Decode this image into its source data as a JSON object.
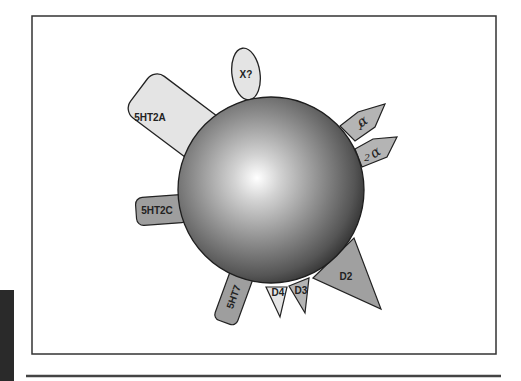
{
  "figure": {
    "type": "receptor-binding diagram",
    "center": "drug molecule (sphere)",
    "receptors": [
      {
        "id": "5ht2a",
        "label": "5HT2A",
        "shape": "rounded-rectangle",
        "fill": "#e4e4e4"
      },
      {
        "id": "x",
        "label": "X?",
        "shape": "ellipse",
        "fill": "#e4e4e4"
      },
      {
        "id": "alpha1",
        "label": "α",
        "subscript": "1",
        "shape": "pentagon-arrow",
        "fill": "#b4b4b4"
      },
      {
        "id": "alpha2",
        "label": "α",
        "subscript": "2",
        "shape": "pentagon-arrow",
        "fill": "#b4b4b4"
      },
      {
        "id": "5ht2c",
        "label": "5HT2C",
        "shape": "rounded-rectangle",
        "fill": "#9e9e9e"
      },
      {
        "id": "5ht7",
        "label": "5HT7",
        "shape": "rounded-rectangle",
        "fill": "#9e9e9e"
      },
      {
        "id": "d4",
        "label": "D4",
        "shape": "triangle",
        "fill": "#e4e4e4"
      },
      {
        "id": "d3",
        "label": "D3",
        "shape": "triangle",
        "fill": "#b4b4b4"
      },
      {
        "id": "d2",
        "label": "D2",
        "shape": "triangle",
        "fill": "#a0a0a0"
      }
    ]
  },
  "colors": {
    "outline": "#222222",
    "frame": "#333333",
    "sphere_highlight": "#ffffff",
    "sphere_mid": "#8a8a8a",
    "sphere_edge": "#2e2e2e"
  }
}
